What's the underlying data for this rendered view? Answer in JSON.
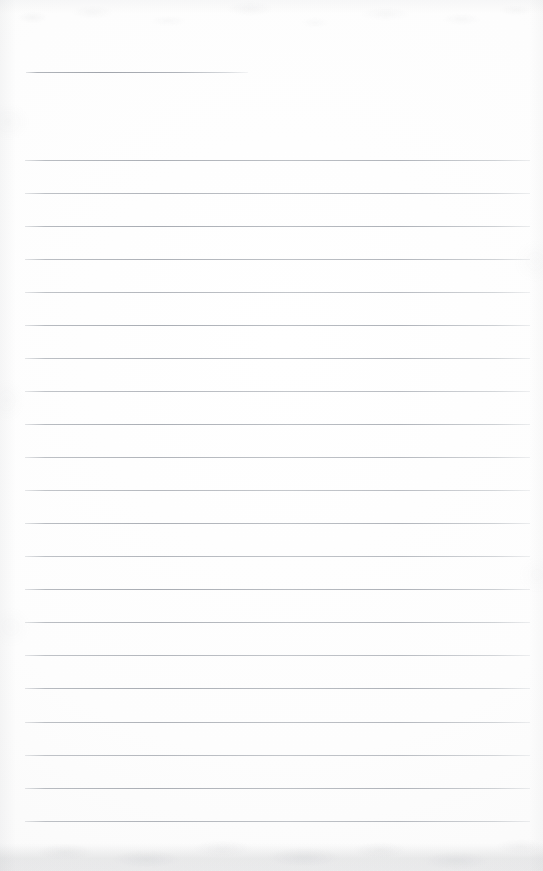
{
  "document": {
    "kind": "scanned-lined-notebook-page",
    "title": "",
    "body_text": "",
    "page_width": 543,
    "page_height": 871,
    "paper_color": "#fdfdfd",
    "rule_color": "#a8acb3",
    "edge_shadow_color": "#94979d"
  },
  "header_rule": {
    "label": "",
    "x": 26,
    "y": 72,
    "width": 222,
    "thickness": 1
  },
  "body_rules": {
    "count": 21,
    "x": 25,
    "width": 505,
    "first_y": 160,
    "spacing": 33.05,
    "thickness": 1,
    "lines": [
      {
        "index": 1,
        "y": 160,
        "text": ""
      },
      {
        "index": 2,
        "y": 193,
        "text": ""
      },
      {
        "index": 3,
        "y": 226,
        "text": ""
      },
      {
        "index": 4,
        "y": 259,
        "text": ""
      },
      {
        "index": 5,
        "y": 292,
        "text": ""
      },
      {
        "index": 6,
        "y": 325,
        "text": ""
      },
      {
        "index": 7,
        "y": 358,
        "text": ""
      },
      {
        "index": 8,
        "y": 391,
        "text": ""
      },
      {
        "index": 9,
        "y": 424,
        "text": ""
      },
      {
        "index": 10,
        "y": 457,
        "text": ""
      },
      {
        "index": 11,
        "y": 490,
        "text": ""
      },
      {
        "index": 12,
        "y": 523,
        "text": ""
      },
      {
        "index": 13,
        "y": 556,
        "text": ""
      },
      {
        "index": 14,
        "y": 589,
        "text": ""
      },
      {
        "index": 15,
        "y": 622,
        "text": ""
      },
      {
        "index": 16,
        "y": 655,
        "text": ""
      },
      {
        "index": 17,
        "y": 688,
        "text": ""
      },
      {
        "index": 18,
        "y": 722,
        "text": ""
      },
      {
        "index": 19,
        "y": 755,
        "text": ""
      },
      {
        "index": 20,
        "y": 788,
        "text": ""
      },
      {
        "index": 21,
        "y": 821,
        "text": ""
      }
    ]
  },
  "bottom_edge": {
    "y": 843,
    "height": 28
  }
}
